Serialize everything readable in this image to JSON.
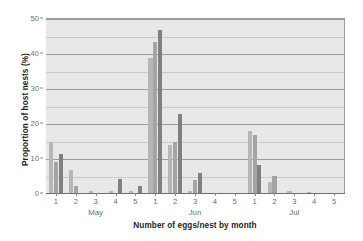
{
  "chart_data": {
    "type": "bar",
    "title": "",
    "xlabel": "Number of eggs/nest by month",
    "ylabel": "Proportion of host nests (%)",
    "categories": [
      "1",
      "2",
      "3",
      "4",
      "5",
      "1",
      "2",
      "3",
      "4",
      "5",
      "1",
      "2",
      "3",
      "4",
      "5"
    ],
    "group_labels": [
      "May",
      "Jun",
      "Jul"
    ],
    "group_spans": [
      [
        0,
        4
      ],
      [
        5,
        9
      ],
      [
        10,
        14
      ]
    ],
    "ylim": [
      0,
      50
    ],
    "yticks": [
      0,
      10,
      20,
      30,
      40,
      50
    ],
    "ytick_labels": [
      "0",
      "10",
      "20",
      "30",
      "40",
      "50"
    ],
    "minor_gridlines": [
      5,
      15,
      25,
      35,
      45
    ],
    "grid": true,
    "legend": "none",
    "series": [
      {
        "name": "series-1",
        "color": "#b6b7b9",
        "values": [
          15.0,
          7.0,
          1.0,
          0.8,
          1.0,
          39.0,
          14.0,
          1.0,
          0.3,
          0.3,
          18.0,
          3.3,
          1.0,
          0.5,
          0.0
        ]
      },
      {
        "name": "series-2",
        "color": "#a2a4a6",
        "values": [
          9.2,
          2.4,
          0.0,
          0.0,
          0.0,
          43.3,
          15.0,
          4.0,
          0.0,
          0.0,
          17.0,
          5.1,
          0.0,
          0.0,
          0.0
        ]
      },
      {
        "name": "series-3",
        "color": "#7e8082",
        "values": [
          11.3,
          0.0,
          0.0,
          4.2,
          2.2,
          47.0,
          23.0,
          6.1,
          0.0,
          0.0,
          8.2,
          0.0,
          0.0,
          0.0,
          0.0
        ]
      }
    ]
  },
  "axes": {
    "plot_bg": "#e8e8e8",
    "grid_color": "#9a9c9e",
    "minor_grid_color": "#c9cacb",
    "tick_text_color": "#6d6e71",
    "title_text_color": "#231f20"
  }
}
